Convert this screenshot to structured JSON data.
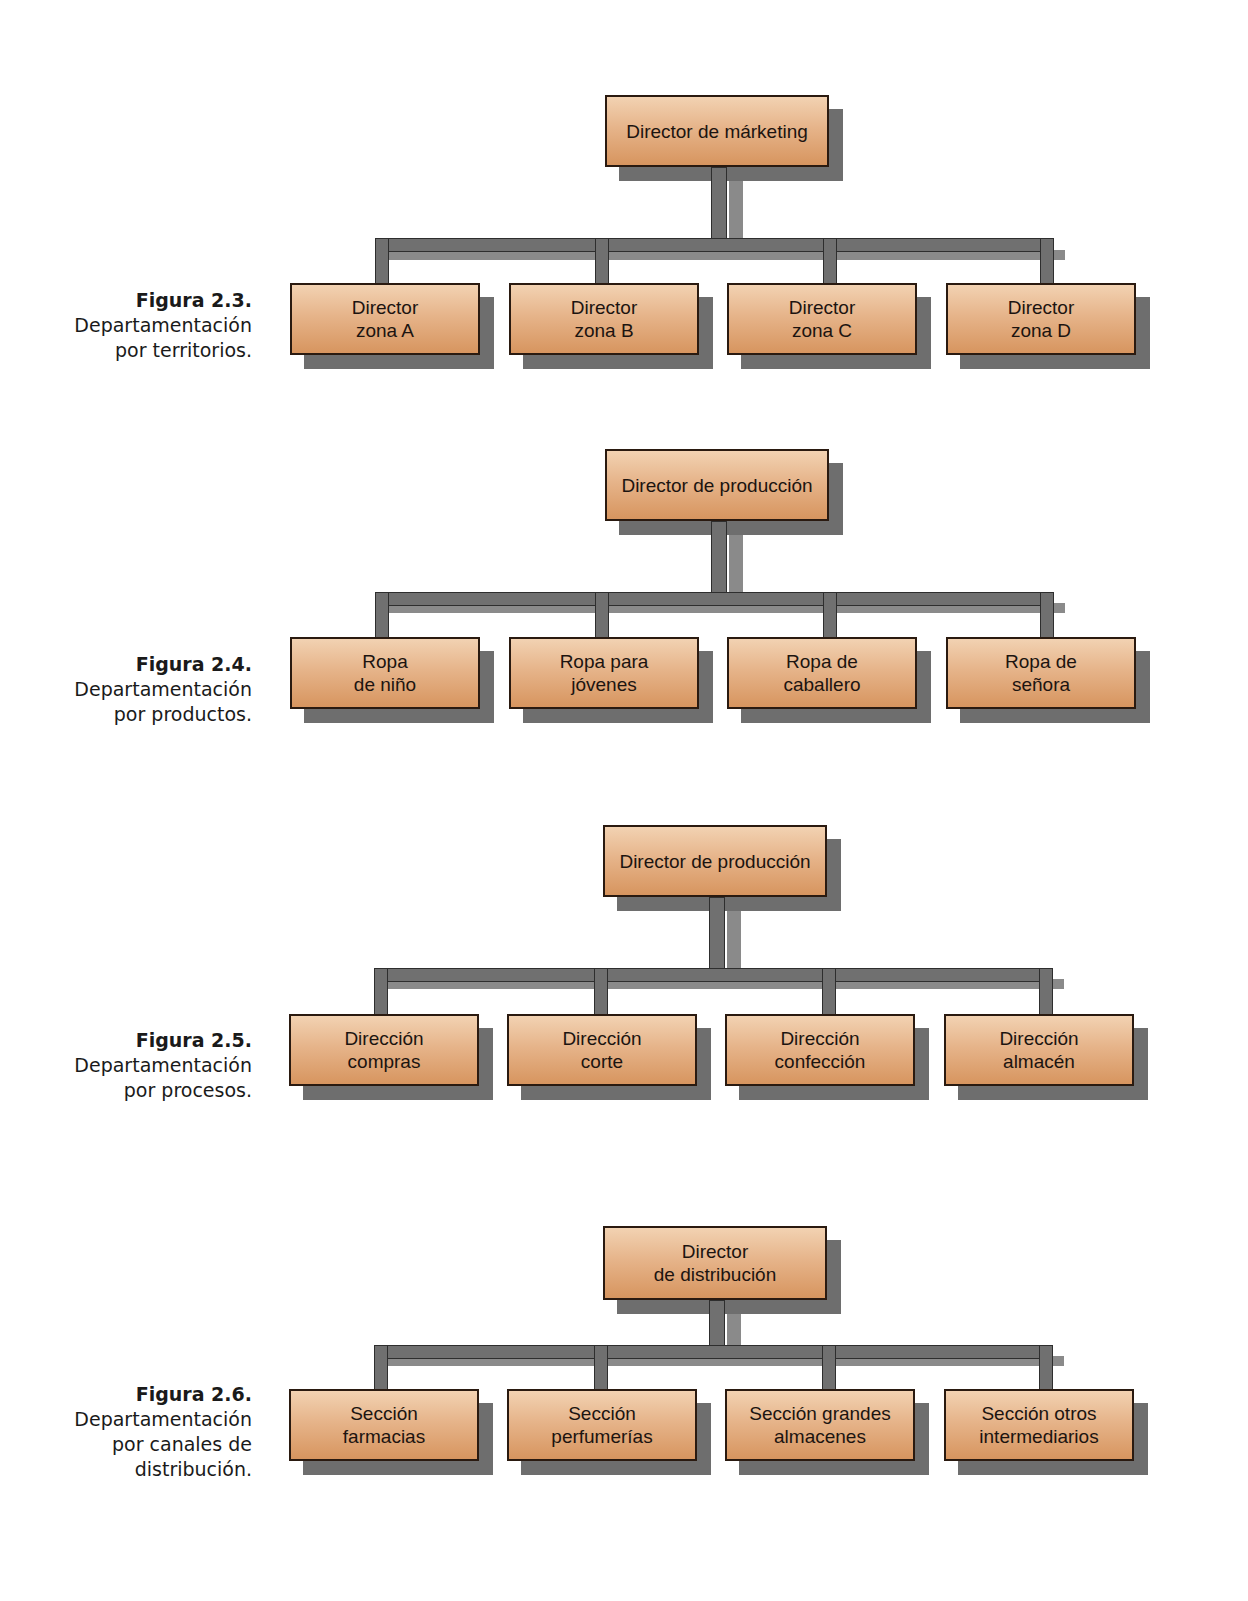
{
  "colors": {
    "box_fill_top": "#f2d2b2",
    "box_fill_bottom": "#d7955f",
    "box_border": "#2a1a10",
    "shadow": "#6e6e6e",
    "connector": "#707070"
  },
  "figures": [
    {
      "number": "Figura 2.3.",
      "description": "Departamentación\npor territorios.",
      "root": "Director de márketing",
      "children": [
        "Director\nzona A",
        "Director\nzona B",
        "Director\nzona C",
        "Director\nzona D"
      ]
    },
    {
      "number": "Figura 2.4.",
      "description": "Departamentación\npor productos.",
      "root": "Director de producción",
      "children": [
        "Ropa\nde niño",
        "Ropa para\njóvenes",
        "Ropa de\ncaballero",
        "Ropa de\nseñora"
      ]
    },
    {
      "number": "Figura 2.5.",
      "description": "Departamentación\npor procesos.",
      "root": "Director de producción",
      "children": [
        "Dirección\ncompras",
        "Dirección\ncorte",
        "Dirección\nconfección",
        "Dirección\nalmacén"
      ]
    },
    {
      "number": "Figura 2.6.",
      "description": "Departamentación\npor canales de\ndistribución.",
      "root": "Director\nde distribución",
      "children": [
        "Sección\nfarmacias",
        "Sección\nperfumerías",
        "Sección grandes\nalmacenes",
        "Sección otros\nintermediarios"
      ]
    }
  ]
}
